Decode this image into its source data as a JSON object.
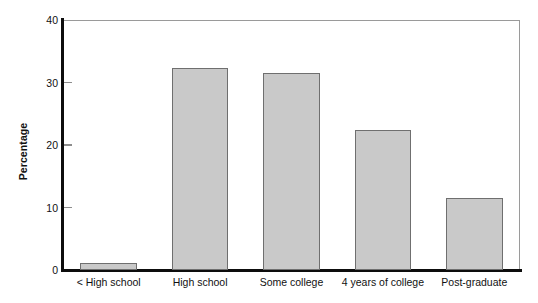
{
  "chart_data": {
    "type": "bar",
    "title": "",
    "xlabel": "",
    "ylabel": "Percentage",
    "categories": [
      "< High school",
      "High school",
      "Some college",
      "4 years of college",
      "Post-graduate"
    ],
    "values": [
      1.1,
      32.3,
      31.6,
      22.4,
      11.5
    ],
    "ylim": [
      0,
      40
    ],
    "yticks": [
      0,
      10,
      20,
      30,
      40
    ],
    "ytick_labels": [
      "0",
      "10",
      "20",
      "30",
      "40"
    ],
    "grid": false,
    "legend": null,
    "bar_fill_color": "#c9c9c9",
    "bar_edge_color": "#6f6f6f",
    "axis_color": "#0d0d0d",
    "frame_color": "#9a9a9a"
  }
}
